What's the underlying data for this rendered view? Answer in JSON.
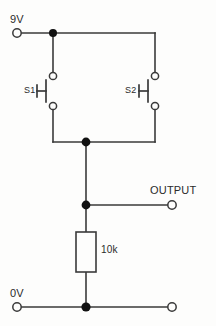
{
  "diagram": {
    "stroke_color": "#3a3a3a",
    "node_color": "#111111",
    "background": "#fdfdfc"
  },
  "labels": {
    "supply_positive": "9V",
    "supply_ground": "0V",
    "output": "OUTPUT",
    "switch_1": "S1",
    "switch_2": "S2",
    "resistor_value": "10k"
  },
  "components": [
    {
      "ref": "S1",
      "type": "pushbutton-switch",
      "label": "S1"
    },
    {
      "ref": "S2",
      "type": "pushbutton-switch",
      "label": "S2"
    },
    {
      "ref": "R1",
      "type": "resistor",
      "label": "10k"
    }
  ],
  "terminals": [
    {
      "name": "9V",
      "label": "9V",
      "style": "open-circle"
    },
    {
      "name": "OUTPUT",
      "label": "OUTPUT",
      "style": "open-circle"
    },
    {
      "name": "0V-left",
      "label": "0V",
      "style": "open-circle"
    },
    {
      "name": "0V-right",
      "label": "",
      "style": "open-circle"
    }
  ],
  "junctions": [
    {
      "name": "supply-rail-node"
    },
    {
      "name": "switch-common-node"
    },
    {
      "name": "output-node"
    },
    {
      "name": "ground-node"
    }
  ]
}
